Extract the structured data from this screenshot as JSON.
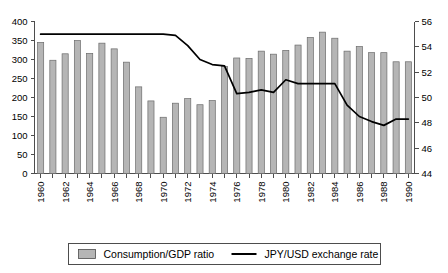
{
  "chart_data": {
    "type": "bar",
    "title": "",
    "xlabel": "",
    "ylabel": "",
    "grid": false,
    "legend_position": "bottom",
    "categories": [
      "1960",
      "1961",
      "1962",
      "1963",
      "1964",
      "1965",
      "1966",
      "1967",
      "1968",
      "1969",
      "1970",
      "1971",
      "1972",
      "1973",
      "1974",
      "1975",
      "1976",
      "1977",
      "1978",
      "1979",
      "1980",
      "1981",
      "1982",
      "1983",
      "1984",
      "1985",
      "1986",
      "1987",
      "1988",
      "1989",
      "1990"
    ],
    "x_tick_labels": [
      "1960",
      "1962",
      "1964",
      "1966",
      "1968",
      "1970",
      "1972",
      "1974",
      "1976",
      "1978",
      "1980",
      "1982",
      "1984",
      "1986",
      "1988",
      "1990"
    ],
    "y_left": {
      "label": "",
      "ticks": [
        0,
        50,
        100,
        150,
        200,
        250,
        300,
        350,
        400
      ],
      "ylim": [
        0,
        400
      ]
    },
    "y_right": {
      "label": "",
      "ticks": [
        44,
        46,
        48,
        50,
        52,
        54,
        56
      ],
      "ylim": [
        44,
        56
      ]
    },
    "series": [
      {
        "name": "Consumption/GDP ratio",
        "type": "bar",
        "axis": "left",
        "color": "#b5b5b5",
        "values": [
          345,
          298,
          315,
          350,
          316,
          343,
          328,
          293,
          228,
          191,
          148,
          185,
          197,
          181,
          192,
          282,
          304,
          303,
          322,
          314,
          324,
          338,
          358,
          372,
          356,
          322,
          334,
          318,
          318,
          294,
          294
        ]
      },
      {
        "name": "JPY/USD exchange rate",
        "type": "line",
        "axis": "right",
        "color": "#000000",
        "values": [
          55.0,
          55.0,
          55.0,
          55.0,
          55.0,
          55.0,
          55.0,
          55.0,
          55.0,
          55.0,
          55.0,
          54.9,
          54.1,
          53.0,
          52.6,
          52.5,
          50.3,
          50.4,
          50.6,
          50.4,
          51.4,
          51.1,
          51.1,
          51.1,
          51.1,
          49.4,
          48.5,
          48.1,
          47.8,
          48.3,
          48.3
        ]
      }
    ]
  },
  "legend": {
    "items": [
      {
        "label": "Consumption/GDP ratio",
        "marker": "swatch"
      },
      {
        "label": "JPY/USD exchange rate",
        "marker": "line"
      }
    ]
  }
}
